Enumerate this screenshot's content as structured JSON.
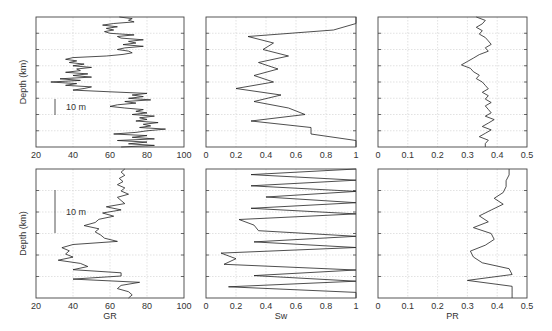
{
  "figure": {
    "ylabel": "Depth (km)",
    "scale_bar_label": "10 m"
  },
  "chart_data": [
    {
      "type": "line",
      "panel": "top-left",
      "xlabel": "",
      "ylabel": "Depth (km)",
      "xlim": [
        20,
        100
      ],
      "xticks": [
        20,
        40,
        60,
        80,
        100
      ],
      "grid": true,
      "annotation": "10 m",
      "series": [
        {
          "name": "GR",
          "x": [
            65,
            72,
            70,
            73,
            62,
            56,
            64,
            58,
            62,
            57,
            60,
            73,
            64,
            66,
            78,
            70,
            74,
            67,
            78,
            68,
            64,
            70,
            72,
            67,
            58,
            40,
            36,
            42,
            38,
            46,
            40,
            50,
            42,
            44,
            36,
            48,
            40,
            50,
            33,
            44,
            28,
            42,
            36,
            50,
            46,
            40,
            60,
            80,
            72,
            78,
            70,
            82,
            68,
            74,
            64,
            60,
            68,
            78,
            74,
            80,
            72,
            84,
            76,
            80,
            74,
            86,
            78,
            82,
            76,
            90,
            80,
            74,
            62,
            80,
            72,
            84,
            64,
            80,
            70,
            84,
            66
          ],
          "y_px_fraction": "depth increases downward"
        }
      ]
    },
    {
      "type": "line",
      "panel": "top-middle",
      "xlabel": "",
      "xlim": [
        0,
        1
      ],
      "xticks": [
        0,
        0.2,
        0.4,
        0.6,
        0.8,
        1
      ],
      "grid": true,
      "series": [
        {
          "name": "Sw",
          "x": [
            1,
            1,
            0.85,
            0.28,
            0.45,
            0.38,
            0.55,
            0.35,
            0.48,
            0.32,
            0.45,
            0.2,
            0.5,
            0.32,
            0.55,
            0.66,
            0.3,
            0.7,
            0.7,
            1,
            1
          ]
        }
      ]
    },
    {
      "type": "line",
      "panel": "top-right",
      "xlabel": "",
      "xlim": [
        0,
        0.5
      ],
      "xticks": [
        0,
        0.1,
        0.2,
        0.3,
        0.4,
        0.5
      ],
      "grid": true,
      "series": [
        {
          "name": "PR",
          "x": [
            0.33,
            0.36,
            0.35,
            0.33,
            0.35,
            0.34,
            0.36,
            0.37,
            0.38,
            0.36,
            0.37,
            0.34,
            0.32,
            0.3,
            0.28,
            0.31,
            0.32,
            0.34,
            0.33,
            0.35,
            0.36,
            0.37,
            0.35,
            0.37,
            0.36,
            0.38,
            0.36,
            0.37,
            0.38,
            0.36,
            0.39,
            0.37,
            0.35,
            0.38,
            0.36,
            0.34,
            0.37,
            0.36,
            0.36
          ]
        }
      ]
    },
    {
      "type": "line",
      "panel": "bottom-left",
      "xlabel": "GR",
      "ylabel": "Depth (km)",
      "xlim": [
        20,
        100
      ],
      "xticks": [
        20,
        40,
        60,
        80,
        100
      ],
      "grid": true,
      "annotation": "10 m",
      "series": [
        {
          "name": "GR",
          "x": [
            68,
            66,
            68,
            65,
            67,
            64,
            68,
            66,
            70,
            64,
            66,
            68,
            58,
            66,
            56,
            62,
            54,
            52,
            46,
            54,
            52,
            55,
            57,
            64,
            40,
            34,
            38,
            36,
            40,
            32,
            44,
            48,
            40,
            66,
            66,
            40,
            76,
            66,
            64,
            70,
            72,
            70
          ]
        }
      ]
    },
    {
      "type": "line",
      "panel": "bottom-middle",
      "xlabel": "Sw",
      "xlim": [
        0,
        1
      ],
      "xticks": [
        0,
        0.2,
        0.4,
        0.6,
        0.8,
        1
      ],
      "grid": true,
      "series": [
        {
          "name": "Sw",
          "x": [
            1,
            0.3,
            1,
            0.3,
            1,
            0.4,
            1,
            0.3,
            1,
            0.22,
            0.32,
            0.35,
            1,
            0.32,
            1,
            0.1,
            0.2,
            0.12,
            1,
            0.32,
            1,
            0.15,
            1,
            1
          ]
        }
      ]
    },
    {
      "type": "line",
      "panel": "bottom-right",
      "xlabel": "PR",
      "xlim": [
        0,
        0.5
      ],
      "xticks": [
        0,
        0.1,
        0.2,
        0.3,
        0.4,
        0.5
      ],
      "grid": true,
      "series": [
        {
          "name": "PR",
          "x": [
            0.44,
            0.44,
            0.43,
            0.43,
            0.42,
            0.39,
            0.42,
            0.38,
            0.34,
            0.37,
            0.32,
            0.38,
            0.39,
            0.36,
            0.31,
            0.32,
            0.35,
            0.44,
            0.45,
            0.3,
            0.45,
            0.45,
            0.45
          ]
        }
      ]
    }
  ],
  "axes": {
    "gr_ticks": [
      "20",
      "40",
      "60",
      "80",
      "100"
    ],
    "sw_ticks": [
      "0",
      "0.2",
      "0.4",
      "0.6",
      "0.8",
      "1"
    ],
    "pr_ticks": [
      "0",
      "0.1",
      "0.2",
      "0.3",
      "0.4",
      "0.5"
    ],
    "xlabels": {
      "gr": "GR",
      "sw": "Sw",
      "pr": "PR"
    }
  }
}
